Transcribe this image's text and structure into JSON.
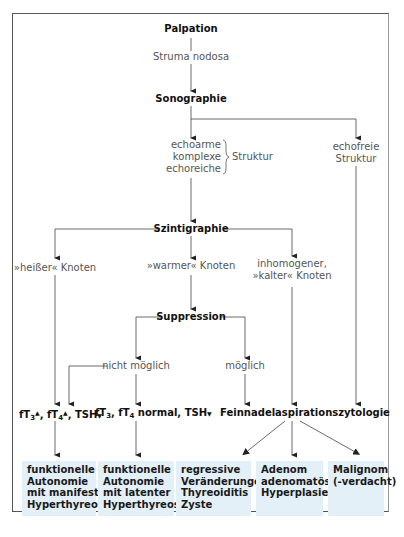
{
  "diagram": {
    "type": "flowchart",
    "colors": {
      "line": "#333333",
      "box_fill": "#e3f0f8",
      "frame": "#555555"
    },
    "nodes": {
      "palpation": "Palpation",
      "struma": "Struma nodosa",
      "sonographie": "Sonographie",
      "echo_lines": [
        "echoarme",
        "komplexe",
        "echoreiche"
      ],
      "echo_struktur": "Struktur",
      "echofrei_lines": [
        "echofreie",
        "Struktur"
      ],
      "szintigraphie": "Szintigraphie",
      "heisser": "»heißer« Knoten",
      "warmer": "»warmer« Knoten",
      "kalter_lines": [
        "inhomogener,",
        "»kalter« Knoten"
      ],
      "suppression": "Suppression",
      "nicht_moeglich": "nicht möglich",
      "moeglich": "möglich",
      "lab_hot": {
        "ft3": "fT",
        "ft3_sub": "3",
        "up": "▲",
        "sep": ", ",
        "ft4": "fT",
        "ft4_sub": "4",
        "tsh": "TSH",
        "down": "▼"
      },
      "lab_warm": {
        "ft3": "fT",
        "ft3_sub": "3",
        "comma": ", ",
        "ft4": "fT",
        "ft4_sub": "4",
        "normal": " normal, TSH",
        "down": "▼"
      },
      "fnac": "Feinnadelaspirationszytologie"
    },
    "results": [
      {
        "lines": [
          "funktionelle",
          "Autonomie",
          "mit manifester",
          "Hyperthyreose"
        ]
      },
      {
        "lines": [
          "funktionelle",
          "Autonomie",
          "mit latenter",
          "Hyperthyreose"
        ]
      },
      {
        "lines": [
          "regressive",
          "Veränderungen",
          "Thyreoiditis",
          "Zyste"
        ]
      },
      {
        "lines": [
          "Adenom",
          "adenomatöse",
          "Hyperplasie"
        ]
      },
      {
        "lines": [
          "Malignom",
          "(-verdacht)"
        ]
      }
    ],
    "edges": [
      [
        "Palpation",
        "Sonographie"
      ],
      [
        "Sonographie",
        "echoarme/komplexe/echoreiche Struktur"
      ],
      [
        "Sonographie",
        "echofreie Struktur"
      ],
      [
        "echoarme/komplexe/echoreiche Struktur",
        "Szintigraphie"
      ],
      [
        "echofreie Struktur",
        "Feinnadelaspirationszytologie"
      ],
      [
        "Szintigraphie",
        "»heißer« Knoten"
      ],
      [
        "Szintigraphie",
        "»warmer« Knoten"
      ],
      [
        "Szintigraphie",
        "inhomogener, »kalter« Knoten"
      ],
      [
        "»heißer« Knoten",
        "fT3↑, fT4↑, TSH↓"
      ],
      [
        "»warmer« Knoten",
        "Suppression"
      ],
      [
        "Suppression",
        "nicht möglich"
      ],
      [
        "Suppression",
        "möglich"
      ],
      [
        "nicht möglich",
        "fT3↑, fT4↑, TSH↓"
      ],
      [
        "nicht möglich",
        "fT3, fT4 normal, TSH↓"
      ],
      [
        "möglich",
        "Feinnadelaspirationszytologie"
      ],
      [
        "inhomogener, »kalter« Knoten",
        "Feinnadelaspirationszytologie"
      ],
      [
        "fT3↑, fT4↑, TSH↓",
        "funktionelle Autonomie mit manifester Hyperthyreose"
      ],
      [
        "fT3, fT4 normal, TSH↓",
        "funktionelle Autonomie mit latenter Hyperthyreose"
      ],
      [
        "Feinnadelaspirationszytologie",
        "regressive Veränderungen / Thyreoiditis / Zyste"
      ],
      [
        "Feinnadelaspirationszytologie",
        "Adenom / adenomatöse Hyperplasie"
      ],
      [
        "Feinnadelaspirationszytologie",
        "Malignom (-verdacht)"
      ]
    ]
  }
}
